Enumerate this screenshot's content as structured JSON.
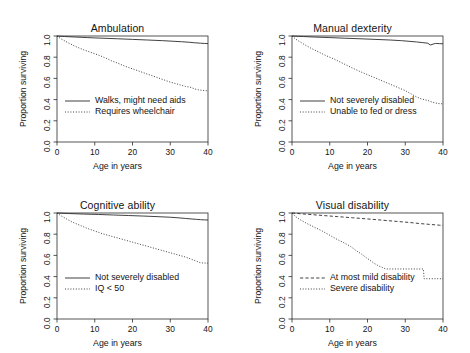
{
  "figure": {
    "layout": "2x2 grid of Kaplan-Meier survival curve panels",
    "axis_labels": {
      "x": "Age in years",
      "y": "Proportion surviving"
    },
    "x_ticks": [
      "0",
      "10",
      "20",
      "30",
      "40"
    ],
    "y_ticks": [
      "0.0",
      "0.2",
      "0.4",
      "0.6",
      "0.8",
      "1.0"
    ],
    "line_color": "#2b2b2b"
  },
  "chart_data": [
    {
      "type": "line",
      "title": "Ambulation",
      "xlabel": "Age in years",
      "ylabel": "Proportion surviving",
      "xlim": [
        0,
        40
      ],
      "ylim": [
        0.0,
        1.0
      ],
      "xticks": [
        0,
        10,
        20,
        30,
        40
      ],
      "yticks": [
        0.0,
        0.2,
        0.4,
        0.6,
        0.8,
        1.0
      ],
      "grid": false,
      "legend_position": "lower left",
      "series": [
        {
          "name": "Walks, might need aids",
          "style": "solid",
          "x": [
            0,
            2,
            5,
            8,
            10,
            13,
            16,
            20,
            24,
            28,
            31,
            33,
            35,
            36.5,
            38,
            39,
            40
          ],
          "y": [
            1.0,
            0.995,
            0.99,
            0.985,
            0.982,
            0.978,
            0.974,
            0.968,
            0.962,
            0.956,
            0.95,
            0.946,
            0.941,
            0.936,
            0.932,
            0.93,
            0.928
          ]
        },
        {
          "name": "Requires wheelchair",
          "style": "dotted",
          "x": [
            0,
            1,
            3,
            5,
            7,
            9,
            11,
            13,
            14.5,
            16,
            18,
            20,
            22,
            24,
            26,
            28,
            30,
            32,
            34,
            35.5,
            36.5,
            37.5,
            38.5,
            39.5,
            40
          ],
          "y": [
            1.0,
            0.975,
            0.935,
            0.9,
            0.87,
            0.845,
            0.82,
            0.79,
            0.765,
            0.745,
            0.715,
            0.69,
            0.665,
            0.64,
            0.615,
            0.59,
            0.565,
            0.545,
            0.525,
            0.515,
            0.5,
            0.492,
            0.487,
            0.484,
            0.482
          ]
        }
      ]
    },
    {
      "type": "line",
      "title": "Manual dexterity",
      "xlabel": "Age in years",
      "ylabel": "Proportion surviving",
      "xlim": [
        0,
        40
      ],
      "ylim": [
        0.0,
        1.0
      ],
      "xticks": [
        0,
        10,
        20,
        30,
        40
      ],
      "yticks": [
        0.0,
        0.2,
        0.4,
        0.6,
        0.8,
        1.0
      ],
      "grid": false,
      "legend_position": "lower left",
      "series": [
        {
          "name": "Not severely disabled",
          "style": "solid",
          "x": [
            0,
            3,
            6,
            10,
            14,
            18,
            22,
            26,
            29,
            31,
            33,
            34.5,
            36,
            36.6,
            38,
            39,
            40
          ],
          "y": [
            1.0,
            0.995,
            0.99,
            0.985,
            0.979,
            0.974,
            0.968,
            0.962,
            0.956,
            0.95,
            0.944,
            0.938,
            0.932,
            0.915,
            0.93,
            0.928,
            0.927
          ]
        },
        {
          "name": "Unable to fed or dress",
          "style": "dotted",
          "x": [
            0,
            1,
            3,
            5,
            7,
            9,
            11,
            13,
            15,
            16.5,
            18,
            20,
            22,
            24,
            26,
            28,
            30,
            31.5,
            33,
            34,
            35,
            36,
            37,
            38,
            39,
            40
          ],
          "y": [
            1.0,
            0.97,
            0.925,
            0.885,
            0.85,
            0.815,
            0.785,
            0.75,
            0.715,
            0.69,
            0.665,
            0.635,
            0.605,
            0.575,
            0.545,
            0.515,
            0.485,
            0.455,
            0.425,
            0.41,
            0.4,
            0.392,
            0.378,
            0.368,
            0.362,
            0.36
          ]
        }
      ]
    },
    {
      "type": "line",
      "title": "Cognitive ability",
      "xlabel": "Age in years",
      "ylabel": "Proportion surviving",
      "xlim": [
        0,
        40
      ],
      "ylim": [
        0.0,
        1.0
      ],
      "xticks": [
        0,
        10,
        20,
        30,
        40
      ],
      "yticks": [
        0.0,
        0.2,
        0.4,
        0.6,
        0.8,
        1.0
      ],
      "grid": false,
      "legend_position": "lower left",
      "series": [
        {
          "name": "Not severely disabled",
          "style": "solid",
          "x": [
            0,
            3,
            7,
            11,
            15,
            19,
            23,
            27,
            30,
            32,
            34,
            35.5,
            37,
            38,
            39,
            40
          ],
          "y": [
            1.0,
            0.995,
            0.99,
            0.986,
            0.981,
            0.976,
            0.971,
            0.965,
            0.96,
            0.955,
            0.949,
            0.944,
            0.94,
            0.937,
            0.935,
            0.934
          ]
        },
        {
          "name": "IQ < 50",
          "style": "dotted",
          "x": [
            0,
            1,
            2.5,
            4,
            6,
            8,
            10,
            12,
            14,
            16,
            18,
            20,
            22,
            24,
            26,
            28,
            30,
            32,
            34,
            35.5,
            37,
            38,
            39,
            40
          ],
          "y": [
            1.0,
            0.975,
            0.945,
            0.915,
            0.885,
            0.855,
            0.83,
            0.805,
            0.785,
            0.765,
            0.745,
            0.725,
            0.705,
            0.685,
            0.665,
            0.645,
            0.625,
            0.605,
            0.585,
            0.565,
            0.545,
            0.53,
            0.528,
            0.527
          ]
        }
      ]
    },
    {
      "type": "line",
      "title": "Visual disability",
      "xlabel": "Age in years",
      "ylabel": "Proportion surviving",
      "xlim": [
        0,
        40
      ],
      "ylim": [
        0.0,
        1.0
      ],
      "xticks": [
        0,
        10,
        20,
        30,
        40
      ],
      "yticks": [
        0.0,
        0.2,
        0.4,
        0.6,
        0.8,
        1.0
      ],
      "grid": false,
      "legend_position": "lower left",
      "series": [
        {
          "name": "At most mild disability",
          "style": "dashed",
          "x": [
            0,
            4,
            8,
            12,
            16,
            20,
            24,
            28,
            31,
            34,
            36,
            38,
            39,
            40
          ],
          "y": [
            1.0,
            0.988,
            0.977,
            0.966,
            0.955,
            0.944,
            0.932,
            0.92,
            0.911,
            0.9,
            0.894,
            0.888,
            0.885,
            0.883
          ]
        },
        {
          "name": "Severe disability",
          "style": "dotted",
          "x": [
            0,
            1,
            2,
            4,
            6,
            8,
            10,
            12,
            14,
            15.5,
            17,
            18.5,
            20,
            21,
            22,
            23,
            24,
            24.8,
            27,
            30,
            33,
            34.8,
            35,
            37,
            39,
            40
          ],
          "y": [
            1.0,
            0.965,
            0.94,
            0.9,
            0.865,
            0.83,
            0.79,
            0.75,
            0.715,
            0.685,
            0.645,
            0.61,
            0.57,
            0.545,
            0.52,
            0.5,
            0.485,
            0.472,
            0.472,
            0.472,
            0.472,
            0.472,
            0.38,
            0.38,
            0.38,
            0.38
          ]
        }
      ]
    }
  ]
}
